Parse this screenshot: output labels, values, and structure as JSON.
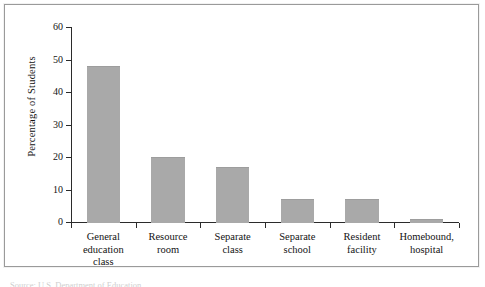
{
  "figure": {
    "source_caption": "Source: U.S. Department of Education"
  },
  "axis": {
    "y_ticks": [
      "0",
      "10",
      "20",
      "30",
      "40",
      "50",
      "60"
    ],
    "y_label": "Percentage of Students"
  },
  "colors": {
    "bar_fill": "#a9a9a9",
    "axis": "#2b2b2b",
    "frame": "#9a9a9a",
    "text": "#131313"
  },
  "chart_data": {
    "type": "bar",
    "title": "",
    "xlabel": "",
    "ylabel": "Percentage of Students",
    "ylim": [
      0,
      60
    ],
    "ytick_interval": 10,
    "grid": false,
    "legend": null,
    "categories": [
      "General education class",
      "Resource room",
      "Separate class",
      "Separate school",
      "Resident facility",
      "Homebound, hospital"
    ],
    "category_lines": [
      [
        "General",
        "education",
        "class"
      ],
      [
        "Resource",
        "room"
      ],
      [
        "Separate",
        "class"
      ],
      [
        "Separate",
        "school"
      ],
      [
        "Resident",
        "facility"
      ],
      [
        "Homebound,",
        "hospital"
      ]
    ],
    "values": [
      48,
      20,
      17,
      7,
      7,
      1
    ]
  }
}
